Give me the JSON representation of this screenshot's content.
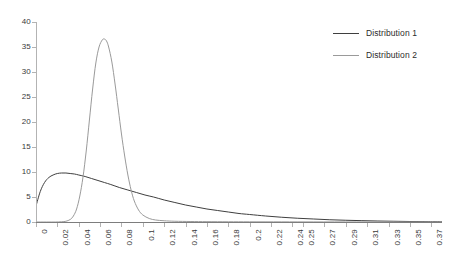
{
  "chart_data": {
    "type": "line",
    "title": "",
    "xlabel": "",
    "ylabel": "",
    "grid": false,
    "legend_position": "top-right",
    "ylim": [
      0,
      40
    ],
    "y_ticks": [
      0,
      5,
      10,
      15,
      20,
      25,
      30,
      35,
      40
    ],
    "y_tick_labels": [
      "0",
      "5",
      "10",
      "15",
      "20",
      "25",
      "30",
      "35",
      "40"
    ],
    "xlim": [
      0,
      0.38
    ],
    "x_tick_labels": [
      "0",
      "0.02",
      "0.04",
      "0.06",
      "0.08",
      "0.1",
      "0.12",
      "0.14",
      "0.16",
      "0.18",
      "0.2",
      "0.22",
      "0.24",
      "0.25",
      "0.27",
      "0.29",
      "0.31",
      "0.33",
      "0.35",
      "0.37"
    ],
    "x_tick_values": [
      0,
      0.02,
      0.04,
      0.06,
      0.08,
      0.1,
      0.12,
      0.14,
      0.16,
      0.18,
      0.2,
      0.22,
      0.24,
      0.25,
      0.27,
      0.29,
      0.31,
      0.33,
      0.35,
      0.37
    ],
    "series": [
      {
        "name": "Distribution 1",
        "color": "#3f3f3f",
        "x": [
          0.0,
          0.004,
          0.008,
          0.012,
          0.016,
          0.02,
          0.024,
          0.028,
          0.032,
          0.036,
          0.04,
          0.046,
          0.052,
          0.058,
          0.064,
          0.07,
          0.078,
          0.086,
          0.094,
          0.102,
          0.11,
          0.12,
          0.13,
          0.14,
          0.15,
          0.16,
          0.17,
          0.18,
          0.19,
          0.2,
          0.215,
          0.23,
          0.245,
          0.26,
          0.275,
          0.29,
          0.305,
          0.32,
          0.335,
          0.35,
          0.365,
          0.38
        ],
        "y": [
          3.2,
          6.1,
          7.9,
          8.9,
          9.4,
          9.7,
          9.8,
          9.8,
          9.7,
          9.6,
          9.4,
          9.1,
          8.7,
          8.3,
          7.9,
          7.5,
          6.9,
          6.4,
          5.9,
          5.4,
          5.0,
          4.4,
          3.9,
          3.4,
          3.0,
          2.6,
          2.3,
          2.0,
          1.7,
          1.5,
          1.2,
          0.95,
          0.75,
          0.6,
          0.45,
          0.35,
          0.27,
          0.2,
          0.15,
          0.1,
          0.07,
          0.05
        ]
      },
      {
        "name": "Distribution 2",
        "color": "#9a9a9a",
        "x": [
          0.0,
          0.01,
          0.018,
          0.024,
          0.028,
          0.032,
          0.035,
          0.038,
          0.041,
          0.044,
          0.047,
          0.05,
          0.053,
          0.056,
          0.059,
          0.062,
          0.064,
          0.066,
          0.068,
          0.071,
          0.074,
          0.077,
          0.08,
          0.083,
          0.086,
          0.089,
          0.092,
          0.096,
          0.1,
          0.106,
          0.112,
          0.12,
          0.13,
          0.145,
          0.16,
          0.18,
          0.2,
          0.23,
          0.26,
          0.3,
          0.34,
          0.38
        ],
        "y": [
          0.0,
          0.0,
          0.0,
          0.05,
          0.15,
          0.5,
          1.2,
          2.6,
          5.2,
          9.0,
          14.2,
          20.4,
          26.6,
          31.8,
          35.0,
          36.4,
          36.6,
          36.2,
          35.0,
          32.0,
          27.6,
          22.6,
          17.6,
          13.2,
          9.4,
          6.4,
          4.2,
          2.4,
          1.4,
          0.7,
          0.4,
          0.25,
          0.15,
          0.1,
          0.07,
          0.05,
          0.04,
          0.03,
          0.02,
          0.015,
          0.01,
          0.01
        ]
      }
    ]
  },
  "legend": {
    "items": [
      {
        "label": "Distribution 1",
        "color": "#3f3f3f"
      },
      {
        "label": "Distribution 2",
        "color": "#9a9a9a"
      }
    ]
  }
}
